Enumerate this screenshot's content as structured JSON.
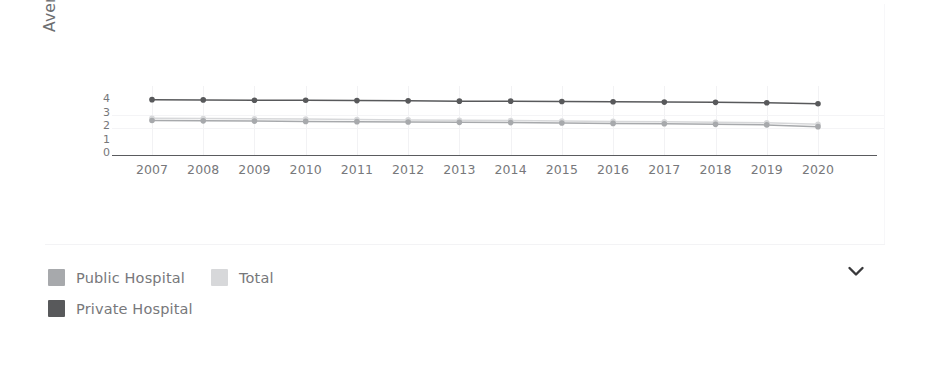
{
  "chart": {
    "ylabel": "Average length of stay (day.",
    "y_ticks": [
      "4",
      "3",
      "2",
      "1",
      "0"
    ],
    "colors": {
      "private_hospital": "#58595b",
      "public_hospital": "#a7a9ac",
      "total": "#d7d8da",
      "axis": "#5a5b5e",
      "grid": "#f2f2f4",
      "text": "#76777a"
    }
  },
  "chart_data": {
    "type": "line",
    "title": "",
    "xlabel": "",
    "ylabel": "Average length of stay (day.",
    "categories": [
      "2007",
      "2008",
      "2009",
      "2010",
      "2011",
      "2012",
      "2013",
      "2014",
      "2015",
      "2016",
      "2017",
      "2018",
      "2019",
      "2020"
    ],
    "x": [
      2007,
      2008,
      2009,
      2010,
      2011,
      2012,
      2013,
      2014,
      2015,
      2016,
      2017,
      2018,
      2019,
      2020
    ],
    "ylim": [
      0,
      4.4
    ],
    "yticks": [
      0,
      1,
      2,
      3,
      4
    ],
    "grid": true,
    "legend_position": "bottom-left",
    "series": [
      {
        "name": "Private Hospital",
        "color": "#58595b",
        "values": [
          4.1,
          4.08,
          4.06,
          4.05,
          4.03,
          4.01,
          3.99,
          3.99,
          3.96,
          3.94,
          3.92,
          3.9,
          3.87,
          3.8
        ]
      },
      {
        "name": "Total",
        "color": "#d7d8da",
        "values": [
          2.72,
          2.7,
          2.68,
          2.66,
          2.63,
          2.6,
          2.57,
          2.55,
          2.52,
          2.49,
          2.46,
          2.42,
          2.38,
          2.28
        ]
      },
      {
        "name": "Public Hospital",
        "color": "#a7a9ac",
        "values": [
          2.55,
          2.53,
          2.51,
          2.49,
          2.47,
          2.45,
          2.42,
          2.4,
          2.37,
          2.34,
          2.31,
          2.27,
          2.23,
          2.1
        ]
      }
    ]
  },
  "legend": {
    "items": [
      {
        "label": "Public Hospital",
        "color": "#a7a9ac"
      },
      {
        "label": "Total",
        "color": "#d7d8da"
      },
      {
        "label": "Private Hospital",
        "color": "#58595b"
      }
    ]
  },
  "controls": {
    "expand_icon": "chevron-down-icon"
  }
}
